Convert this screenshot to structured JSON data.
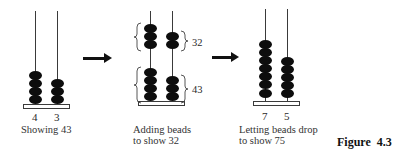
{
  "figure_label": "Figure  4.3",
  "steps": [
    {
      "rods": [
        {
          "digit": "4",
          "beads": 4
        },
        {
          "digit": "3",
          "beads": 3
        }
      ],
      "caption_lines": [
        "Showing 43"
      ]
    },
    {
      "groups": [
        {
          "label": "32",
          "beads": [
            3,
            2
          ]
        },
        {
          "label": "43",
          "beads": [
            4,
            3
          ]
        }
      ],
      "caption_lines": [
        "Adding beads",
        "to show 32"
      ]
    },
    {
      "rods": [
        {
          "digit": "7",
          "beads": 7
        },
        {
          "digit": "5",
          "beads": 5
        }
      ],
      "caption_lines": [
        "Letting beads drop",
        "to show 75"
      ]
    }
  ],
  "arrows": [
    "right-arrow",
    "right-arrow"
  ]
}
